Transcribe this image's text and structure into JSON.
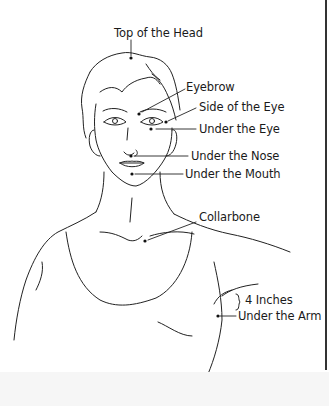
{
  "diagram": {
    "labels": {
      "top_of_head": "Top of the Head",
      "eyebrow": "Eyebrow",
      "side_of_eye": "Side of the Eye",
      "under_eye": "Under the Eye",
      "under_nose": "Under the Nose",
      "under_mouth": "Under the Mouth",
      "collarbone": "Collarbone",
      "four_inches": "4 Inches",
      "under_arm": "Under the Arm"
    }
  }
}
